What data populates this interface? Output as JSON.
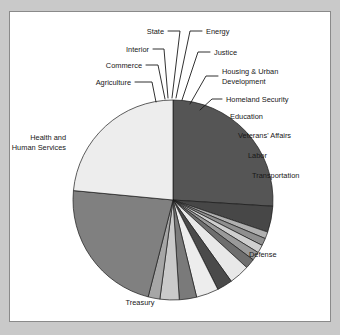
{
  "figure": {
    "panel_background": "#ffffff",
    "outer_background": "#c9c9c9",
    "border_color": "#8a8a8a"
  },
  "chart_data": {
    "type": "pie",
    "title": "",
    "subtitle": "",
    "xlabel": "",
    "ylabel": "",
    "legend_position": "none",
    "grid": false,
    "label_style": "leader-line callouts",
    "center_x": 173,
    "center_y": 200,
    "radius": 100,
    "start_angle_deg": -90,
    "direction": "clockwise",
    "categories": [
      "Health and Human Services",
      "Agriculture",
      "Commerce",
      "Interior",
      "State",
      "Energy",
      "Justice",
      "Housing & Urban Development",
      "Homeland Security",
      "Education",
      "Veterans' Affairs",
      "Labor",
      "Transportation",
      "Defense",
      "Treasury"
    ],
    "values": [
      26.0,
      4.2,
      1.1,
      1.2,
      1.3,
      1.4,
      1.6,
      3.3,
      2.5,
      3.6,
      2.8,
      3.1,
      1.9,
      22.5,
      23.5
    ],
    "unit": "percent",
    "colors": [
      "#555555",
      "#474747",
      "#b0b0b0",
      "#8f8f8f",
      "#cfcfcf",
      "#9a9a9a",
      "#6e6e6e",
      "#e8e8e8",
      "#4a4a4a",
      "#ededed",
      "#7a7a7a",
      "#cacaca",
      "#a6a6a6",
      "#808080",
      "#ededed"
    ],
    "slices": [
      {
        "label": "Health and Human Services",
        "value": 26.0,
        "color": "#555555",
        "label_lines": [
          "Health and",
          "Human Services"
        ],
        "label_anchor": "end",
        "label_x": 66,
        "label_y": 140,
        "leader": ""
      },
      {
        "label": "Agriculture",
        "value": 4.2,
        "color": "#474747",
        "label_lines": [
          "Agriculture"
        ],
        "label_anchor": "end",
        "label_x": 131,
        "label_y": 85,
        "leader": "M135,82 L152,82 L156,102"
      },
      {
        "label": "Commerce",
        "value": 1.1,
        "color": "#b0b0b0",
        "label_lines": [
          "Commerce"
        ],
        "label_anchor": "end",
        "label_x": 142,
        "label_y": 68,
        "leader": "M146,65 L158,65 L165,99"
      },
      {
        "label": "Interior",
        "value": 1.2,
        "color": "#8f8f8f",
        "label_lines": [
          "Interior"
        ],
        "label_anchor": "end",
        "label_x": 149,
        "label_y": 52,
        "leader": "M153,49 L164,49 L168,98"
      },
      {
        "label": "State",
        "value": 1.3,
        "color": "#cfcfcf",
        "label_lines": [
          "State"
        ],
        "label_anchor": "end",
        "label_x": 164,
        "label_y": 34,
        "leader": "M168,31 L180,31 L172,98"
      },
      {
        "label": "Energy",
        "value": 1.4,
        "color": "#9a9a9a",
        "label_lines": [
          "Energy"
        ],
        "label_anchor": "start",
        "label_x": 206,
        "label_y": 34,
        "leader": "M202,31 L190,31 L176,98"
      },
      {
        "label": "Justice",
        "value": 1.6,
        "color": "#6e6e6e",
        "label_lines": [
          "Justice"
        ],
        "label_anchor": "start",
        "label_x": 214,
        "label_y": 55,
        "leader": "M210,52 L198,52 L182,100"
      },
      {
        "label": "Housing & Urban Development",
        "value": 3.3,
        "color": "#e8e8e8",
        "label_lines": [
          "Housing & Urban",
          "Development"
        ],
        "label_anchor": "start",
        "label_x": 222,
        "label_y": 74,
        "leader": "M218,76 L206,76 L190,104"
      },
      {
        "label": "Homeland Security",
        "value": 2.5,
        "color": "#4a4a4a",
        "label_lines": [
          "Homeland Security"
        ],
        "label_anchor": "start",
        "label_x": 226,
        "label_y": 102,
        "leader": "M222,99 L212,99 L200,110"
      },
      {
        "label": "Education",
        "value": 3.6,
        "color": "#ededed",
        "label_lines": [
          "Education"
        ],
        "label_anchor": "start",
        "label_x": 230,
        "label_y": 119,
        "leader": ""
      },
      {
        "label": "Veterans' Affairs",
        "value": 2.8,
        "color": "#7a7a7a",
        "label_lines": [
          "Veterans' Affairs"
        ],
        "label_anchor": "start",
        "label_x": 238,
        "label_y": 138,
        "leader": ""
      },
      {
        "label": "Labor",
        "value": 3.1,
        "color": "#cacaca",
        "label_lines": [
          "Labor"
        ],
        "label_anchor": "start",
        "label_x": 248,
        "label_y": 158,
        "leader": ""
      },
      {
        "label": "Transportation",
        "value": 1.9,
        "color": "#a6a6a6",
        "label_lines": [
          "Transportation"
        ],
        "label_anchor": "start",
        "label_x": 252,
        "label_y": 178,
        "leader": ""
      },
      {
        "label": "Defense",
        "value": 22.5,
        "color": "#808080",
        "label_lines": [
          "Defense"
        ],
        "label_anchor": "start",
        "label_x": 249,
        "label_y": 257,
        "leader": ""
      },
      {
        "label": "Treasury",
        "value": 23.5,
        "color": "#ededed",
        "label_lines": [
          "Treasury"
        ],
        "label_anchor": "middle",
        "label_x": 140,
        "label_y": 305,
        "leader": ""
      }
    ]
  }
}
